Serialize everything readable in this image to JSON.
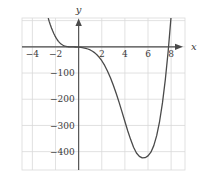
{
  "chart_data": {
    "type": "line",
    "title": "",
    "xlabel": "x",
    "ylabel": "y",
    "xlim": [
      -4.9,
      9.2
    ],
    "ylim": [
      -470,
      110
    ],
    "grid": true,
    "legend": null,
    "x_ticks": [
      {
        "value": -4,
        "label": "−4"
      },
      {
        "value": -2,
        "label": "−2"
      },
      {
        "value": 2,
        "label": "2"
      },
      {
        "value": 4,
        "label": "4"
      },
      {
        "value": 6,
        "label": "6"
      },
      {
        "value": 8,
        "label": "8"
      }
    ],
    "y_ticks": [
      {
        "value": -100,
        "label": "−100"
      },
      {
        "value": -200,
        "label": "−200"
      },
      {
        "value": -300,
        "label": "−300"
      },
      {
        "value": -400,
        "label": "−400"
      }
    ],
    "x_gridlines": [
      -4,
      -2,
      0,
      2,
      4,
      6,
      8
    ],
    "y_gridlines": [
      100,
      0,
      -100,
      -200,
      -300,
      -400
    ],
    "axis_arrows": {
      "x": "right",
      "y": "up"
    },
    "series": [
      {
        "name": "curve",
        "color": "#4a4a4a",
        "x": [
          -2.62,
          -2.55,
          -2.45,
          -2.35,
          -2.25,
          -2.15,
          -2.05,
          -1.95,
          -1.85,
          -1.75,
          -1.65,
          -1.55,
          -1.45,
          -1.35,
          -1.25,
          -1.15,
          -1.05,
          -0.95,
          -0.85,
          -0.75,
          -0.6,
          -0.45,
          -0.3,
          -0.15,
          0.0,
          0.2,
          0.4,
          0.6,
          0.8,
          1.0,
          1.2,
          1.4,
          1.6,
          1.8,
          2.0,
          2.25,
          2.5,
          2.75,
          3.0,
          3.25,
          3.5,
          3.75,
          4.0,
          4.25,
          4.5,
          4.75,
          5.0,
          5.25,
          5.5,
          5.75,
          6.0,
          6.25,
          6.5,
          6.75,
          7.0,
          7.25,
          7.5,
          7.75,
          8.0,
          8.15
        ],
        "y": [
          108,
          97,
          84,
          72,
          61,
          51,
          42,
          34,
          27,
          21,
          16,
          12,
          8.6,
          5.9,
          3.8,
          2.3,
          1.3,
          0.6,
          0.25,
          0.07,
          -0.1,
          -0.3,
          -0.6,
          -0.9,
          -1.3,
          -2.2,
          -3.6,
          -5.6,
          -8.3,
          -12,
          -17,
          -23,
          -31,
          -41,
          -53,
          -71,
          -93,
          -118,
          -147,
          -178,
          -212,
          -248,
          -285,
          -321,
          -354,
          -383,
          -405,
          -418,
          -424,
          -423,
          -416,
          -402,
          -377,
          -339,
          -285,
          -214,
          -124,
          -14,
          118,
          180
        ]
      }
    ],
    "minimum_point": {
      "x": 6.3,
      "y": -424
    },
    "x_intercepts": [
      0.0,
      1.72,
      8.0
    ]
  },
  "axis_labels": {
    "x_name": "x",
    "y_name": "y"
  },
  "style": {
    "grid_color": "#d9d9d9",
    "axis_color": "#4a4a4a",
    "curve_color": "#4a4a4a",
    "background": "#ffffff",
    "text_color": "#3a3a3a"
  }
}
